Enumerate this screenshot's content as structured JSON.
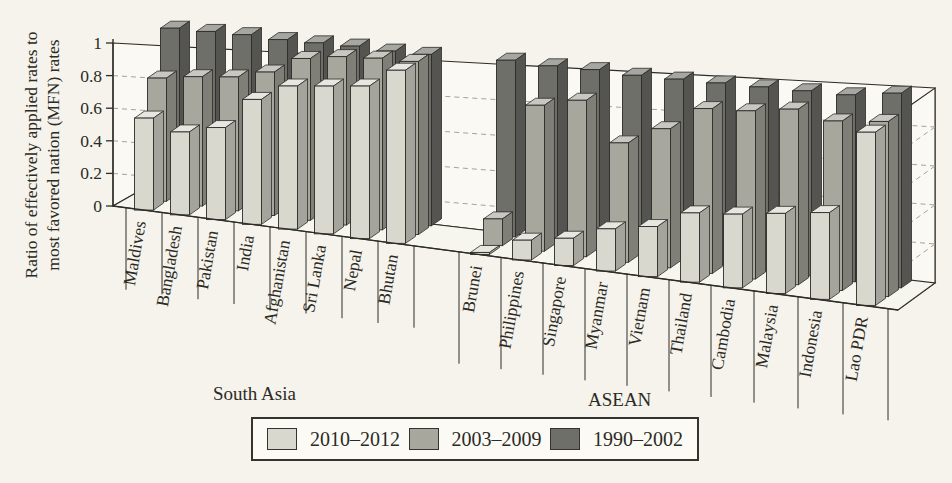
{
  "y_axis": {
    "title_line1": "Ratio of effectively applied rates to",
    "title_line2": "most favored nation (MFN) rates",
    "tick_labels": [
      "1",
      "0.8",
      "0.6",
      "0.4",
      "0.2",
      "0"
    ]
  },
  "groups": [
    {
      "label": "South Asia"
    },
    {
      "label": "ASEAN"
    }
  ],
  "legend": {
    "items": [
      {
        "label": "2010–2012",
        "color": "#d8d8cf"
      },
      {
        "label": "2003–2009",
        "color": "#a7a79e"
      },
      {
        "label": "1990–2002",
        "color": "#6f6f69"
      }
    ]
  },
  "chart_data": {
    "type": "bar",
    "projection": "3d-perspective",
    "title": "",
    "ylabel": "Ratio of effectively applied rates to most favored nation (MFN) rates",
    "ylim": [
      0,
      1
    ],
    "y_ticks": [
      0,
      0.2,
      0.4,
      0.6,
      0.8,
      1
    ],
    "grid": "dashed",
    "legend_position": "bottom",
    "categories": [
      "Maldives",
      "Bangladesh",
      "Pakistan",
      "India",
      "Afghanistan",
      "Sri Lanka",
      "Nepal",
      "Bhutan",
      "Brunei",
      "Philippines",
      "Singapore",
      "Myanmar",
      "Vietnam",
      "Thailand",
      "Cambodia",
      "Malaysia",
      "Indonesia",
      "Lao PDR"
    ],
    "category_groups": {
      "South Asia": [
        "Maldives",
        "Bangladesh",
        "Pakistan",
        "India",
        "Afghanistan",
        "Sri Lanka",
        "Nepal",
        "Bhutan"
      ],
      "ASEAN": [
        "Brunei",
        "Philippines",
        "Singapore",
        "Myanmar",
        "Vietnam",
        "Thailand",
        "Cambodia",
        "Malaysia",
        "Indonesia",
        "Lao PDR"
      ]
    },
    "series": [
      {
        "name": "2010–2012",
        "depth_row": 0,
        "color": "#d8d8cf",
        "values": [
          0.56,
          0.5,
          0.55,
          0.74,
          0.84,
          0.86,
          0.88,
          0.99,
          0.01,
          0.11,
          0.15,
          0.23,
          0.27,
          0.37,
          0.39,
          0.42,
          0.45,
          0.89
        ]
      },
      {
        "name": "2003–2009",
        "depth_row": 1,
        "color": "#a7a79e",
        "values": [
          0.75,
          0.78,
          0.8,
          0.85,
          0.95,
          0.98,
          0.99,
          0.99,
          0.15,
          0.81,
          0.86,
          0.65,
          0.75,
          0.88,
          0.89,
          0.92,
          0.88,
          0.9
        ]
      },
      {
        "name": "1990–2002",
        "depth_row": 2,
        "color": "#6f6f69",
        "values": [
          1.0,
          1.0,
          1.0,
          0.99,
          0.99,
          0.99,
          0.98,
          0.98,
          0.99,
          0.98,
          0.98,
          0.97,
          0.97,
          0.97,
          0.97,
          0.97,
          0.97,
          1.0
        ]
      }
    ]
  }
}
